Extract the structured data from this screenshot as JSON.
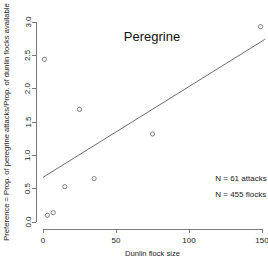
{
  "chart_data": {
    "type": "scatter",
    "title": "Peregrine",
    "xlabel": "Dunlin flock size",
    "ylabel": "Preference = Prop. of peregrine attacks/Prop. of dunlin flocks available",
    "xlim": [
      -6,
      158
    ],
    "ylim": [
      -0.08,
      3.12
    ],
    "xticks": [
      0,
      50,
      100,
      150
    ],
    "xtick_labels": [
      "0",
      "50",
      "100",
      "150"
    ],
    "yticks": [
      0.0,
      0.5,
      1.0,
      1.5,
      2.0,
      2.5,
      3.0
    ],
    "ytick_labels": [
      "0.0",
      "0.5",
      "1.0",
      "1.5",
      "2.0",
      "2.5",
      "3.0"
    ],
    "grid": false,
    "legend": false,
    "marker": "open-circle",
    "points": [
      {
        "x": 1,
        "y": 2.44
      },
      {
        "x": 3,
        "y": 0.1
      },
      {
        "x": 7,
        "y": 0.14
      },
      {
        "x": 15,
        "y": 0.53
      },
      {
        "x": 25,
        "y": 1.69
      },
      {
        "x": 35,
        "y": 0.65
      },
      {
        "x": 75,
        "y": 1.32
      },
      {
        "x": 149,
        "y": 2.93
      }
    ],
    "trendline": {
      "x1": 0,
      "y1": 0.67,
      "x2": 152,
      "y2": 2.74
    },
    "annotations": [
      {
        "text": "N = 61 attacks",
        "x": 118,
        "y": 0.62
      },
      {
        "text": "N = 455 flocks",
        "x": 118,
        "y": 0.38
      }
    ],
    "colors": {
      "axis": "#6b6b6b",
      "marker": "#707070",
      "trendline": "#5a5a5a",
      "text": "#1a1a1a",
      "background": "#ffffff"
    }
  }
}
